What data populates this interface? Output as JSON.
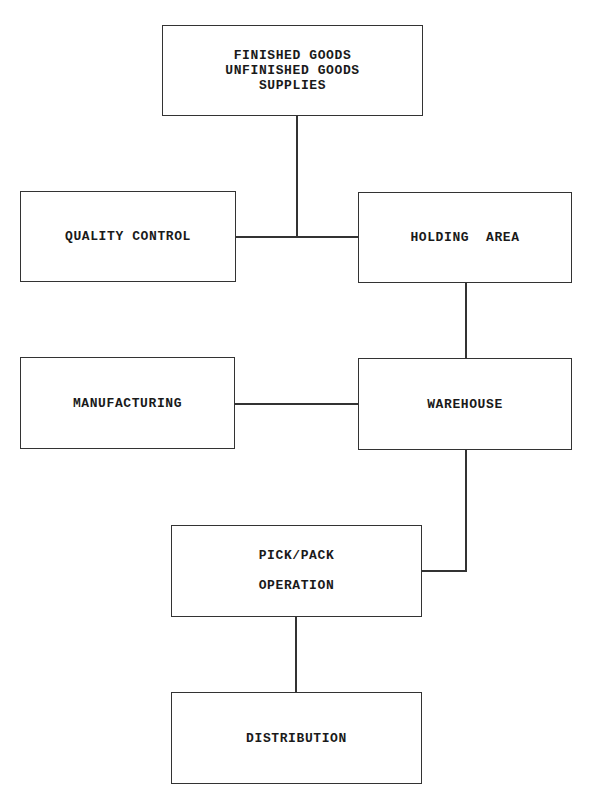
{
  "diagram": {
    "title": "",
    "nodes": [
      {
        "id": "inventory-sources",
        "lines": [
          "FINISHED GOODS",
          "UNFINISHED GOODS",
          "SUPPLIES"
        ],
        "box": {
          "x": 162,
          "y": 25,
          "w": 260,
          "h": 90
        }
      },
      {
        "id": "quality-control",
        "lines": [
          "QUALITY CONTROL"
        ],
        "box": {
          "x": 20,
          "y": 191,
          "w": 215,
          "h": 90
        }
      },
      {
        "id": "holding-area",
        "lines": [
          "HOLDING  AREA"
        ],
        "box": {
          "x": 358,
          "y": 192,
          "w": 213,
          "h": 90
        }
      },
      {
        "id": "manufacturing",
        "lines": [
          "MANUFACTURING"
        ],
        "box": {
          "x": 20,
          "y": 357,
          "w": 214,
          "h": 91
        }
      },
      {
        "id": "warehouse",
        "lines": [
          "WAREHOUSE"
        ],
        "box": {
          "x": 358,
          "y": 358,
          "w": 213,
          "h": 91
        }
      },
      {
        "id": "pick-pack-operation",
        "lines": [
          "PICK/PACK",
          "OPERATION"
        ],
        "box": {
          "x": 171,
          "y": 525,
          "w": 250,
          "h": 91
        }
      },
      {
        "id": "distribution",
        "lines": [
          "DISTRIBUTION"
        ],
        "box": {
          "x": 171,
          "y": 692,
          "w": 250,
          "h": 91
        }
      }
    ],
    "edges": [
      {
        "from": "inventory-sources",
        "to": "quality-control"
      },
      {
        "from": "inventory-sources",
        "to": "holding-area"
      },
      {
        "from": "holding-area",
        "to": "warehouse"
      },
      {
        "from": "manufacturing",
        "to": "warehouse"
      },
      {
        "from": "warehouse",
        "to": "pick-pack-operation"
      },
      {
        "from": "pick-pack-operation",
        "to": "distribution"
      }
    ],
    "colors": {
      "line": "#333333",
      "background": "#ffffff",
      "text": "#1a1a1a"
    }
  }
}
